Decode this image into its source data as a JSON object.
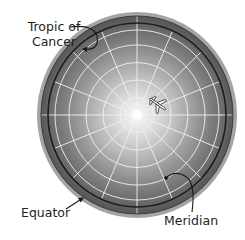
{
  "diagram": {
    "labels": {
      "tropic_line1": "Tropic of",
      "tropic_line2": "Cancer",
      "equator": "Equator",
      "meridian": "Meridian"
    },
    "globe": {
      "center": [
        137,
        115
      ],
      "radius_x": 96,
      "radius_y": 99,
      "meridian_count": 16,
      "latitude_circle_radii": [
        17,
        34,
        51,
        68
      ],
      "tropic_ring_radius": 88,
      "colors": {
        "edge": "#4a4a4a",
        "mid": "#8a8a8a",
        "highlight": "#f4f4f4",
        "grid": "#eeeeee",
        "ring": "#1e1e1e"
      }
    },
    "icons": [
      "airplane-icon",
      "tropic-arrow",
      "equator-arrow",
      "meridian-arrow"
    ]
  }
}
